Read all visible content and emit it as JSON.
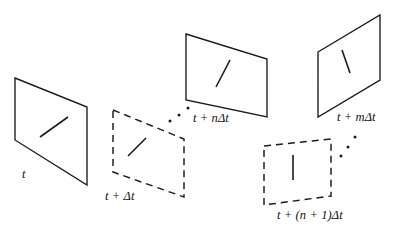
{
  "figure": {
    "kind": "diagram",
    "background_color": "#ffffff",
    "stroke_color": "#1a1a1a",
    "width": 396,
    "height": 237
  },
  "planes": [
    {
      "id": "plane-t",
      "style": "solid",
      "label": {
        "base": "t",
        "plus": "",
        "coeff": "",
        "delta": ""
      },
      "label_text": "t",
      "label_x": 22,
      "label_y": 168,
      "points": "15,78 87,107 87,185 15,140",
      "feature": {
        "x1": 40,
        "y1": 137,
        "x2": 68,
        "y2": 117
      }
    },
    {
      "id": "plane-t-plus-dt",
      "style": "dashed",
      "label_text": "t + Δt",
      "label_x": 105,
      "label_y": 190,
      "points": "113,110 184,139 184,197 113,172",
      "feature": {
        "x1": 128,
        "y1": 156,
        "x2": 146,
        "y2": 138
      }
    },
    {
      "id": "plane-t-plus-n-dt",
      "style": "solid",
      "label_text": "t + nΔt",
      "label_x": 193,
      "label_y": 112,
      "points": "186,34 267,59 267,117 186,100",
      "feature": {
        "x1": 216,
        "y1": 87,
        "x2": 230,
        "y2": 60
      }
    },
    {
      "id": "plane-t-plus-n-plus-1-dt",
      "style": "dashed",
      "label_text": "t + (n + 1)Δt",
      "label_x": 277,
      "label_y": 209,
      "points": "264,146 331,139 331,196 264,205",
      "feature": {
        "x1": 293,
        "y1": 180,
        "x2": 293,
        "y2": 155
      }
    },
    {
      "id": "plane-t-plus-m-dt",
      "style": "solid",
      "label_text": "t + mΔt",
      "label_x": 337,
      "label_y": 111,
      "points": "318,52 380,15 380,80 318,117",
      "feature": {
        "x1": 342,
        "y1": 50,
        "x2": 350,
        "y2": 73
      }
    }
  ],
  "ellipses": [
    {
      "id": "ellipsis-left",
      "dots": [
        {
          "cx": 170,
          "cy": 121,
          "r": 1.5
        },
        {
          "cx": 179,
          "cy": 115,
          "r": 1.5
        },
        {
          "cx": 188,
          "cy": 108,
          "r": 1.5
        }
      ]
    },
    {
      "id": "ellipsis-right",
      "dots": [
        {
          "cx": 341,
          "cy": 156,
          "r": 1.5
        },
        {
          "cx": 348,
          "cy": 147,
          "r": 1.5
        },
        {
          "cx": 355,
          "cy": 137,
          "r": 1.5
        }
      ]
    }
  ],
  "label_parts": {
    "t": {
      "pre": "t",
      "op": "",
      "coeff": "",
      "delta": ""
    },
    "t_plus_dt": {
      "pre": "t",
      "op": "+",
      "coeff": "",
      "delta": "Δt"
    },
    "t_plus_n_dt": {
      "pre": "t",
      "op": "+",
      "coeff": "n",
      "delta": "Δt"
    },
    "t_plus_n1_dt": {
      "pre": "t",
      "op": "+",
      "coeff": "(n + 1)",
      "delta": "Δt"
    },
    "t_plus_m_dt": {
      "pre": "t",
      "op": "+",
      "coeff": "m",
      "delta": "Δt"
    }
  }
}
